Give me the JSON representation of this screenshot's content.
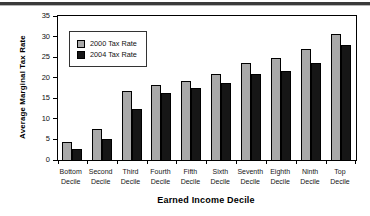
{
  "figure": {
    "top_rule_color": "#3a3a3a"
  },
  "chart_data": {
    "type": "bar",
    "title": "",
    "xlabel": "Earned Income Decile",
    "ylabel": "Average Marginal Tax Rate",
    "categories": [
      "Bottom",
      "Second",
      "Third",
      "Fourth",
      "Fifth",
      "Sixth",
      "Seventh",
      "Eighth",
      "Ninth",
      "Top"
    ],
    "category_suffix": "Decile",
    "series": [
      {
        "name": "2000 Tax Rate",
        "color": "#a9a9a9",
        "values": [
          4.5,
          7.6,
          16.8,
          18.2,
          19.2,
          21.0,
          23.6,
          24.8,
          27.0,
          30.7
        ]
      },
      {
        "name": "2004 Tax Rate",
        "color": "#161616",
        "values": [
          2.7,
          5.2,
          12.4,
          16.2,
          17.6,
          18.6,
          20.8,
          21.7,
          23.5,
          28.0
        ]
      }
    ],
    "ylim": [
      0,
      35
    ],
    "yticks": [
      0,
      5,
      10,
      15,
      20,
      25,
      30,
      35
    ],
    "legend_position": "top-left",
    "grid": false
  }
}
